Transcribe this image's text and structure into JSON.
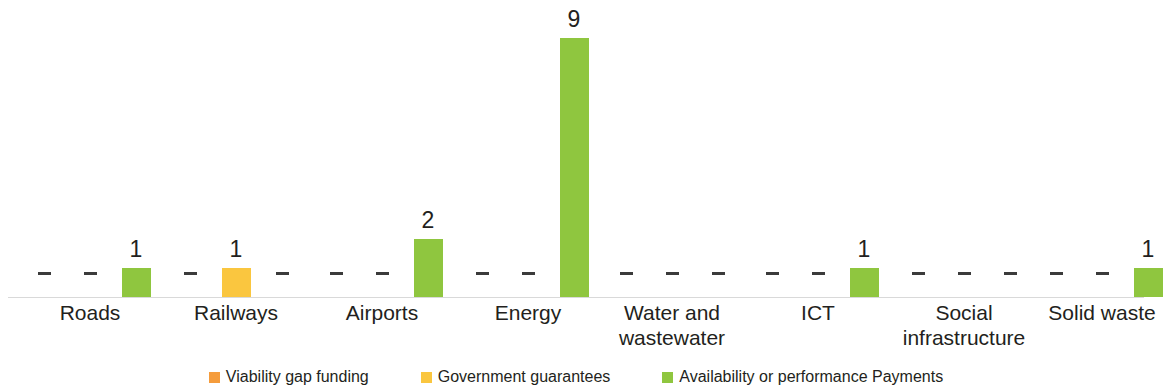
{
  "chart_data": {
    "type": "bar",
    "title": "",
    "subtitle": "",
    "xlabel": "",
    "ylabel": "",
    "grid": false,
    "legend_position": "bottom",
    "ylim": [
      0,
      9
    ],
    "zero_marker": "–",
    "categories": [
      "Roads",
      "Railways",
      "Airports",
      "Energy",
      "Water and wastewater",
      "ICT",
      "Social infrastructure",
      "Solid waste"
    ],
    "category_lines": [
      [
        "Roads"
      ],
      [
        "Railways"
      ],
      [
        "Airports"
      ],
      [
        "Energy"
      ],
      [
        "Water and",
        "wastewater"
      ],
      [
        "ICT"
      ],
      [
        "Social",
        "infrastructure"
      ],
      [
        "Solid waste"
      ]
    ],
    "series": [
      {
        "name": "Viability gap funding",
        "color": "#f59c3c",
        "key": "vgf",
        "values": [
          null,
          null,
          null,
          null,
          null,
          null,
          null,
          null
        ],
        "labels": [
          "–",
          "–",
          "–",
          "–",
          "–",
          "–",
          "–",
          "–"
        ]
      },
      {
        "name": "Government guarantees",
        "color": "#fac63f",
        "key": "gg",
        "values": [
          null,
          1,
          null,
          null,
          null,
          null,
          null,
          null
        ],
        "labels": [
          "–",
          "1",
          "–",
          "–",
          "–",
          "–",
          "–",
          "–"
        ]
      },
      {
        "name": "Availability or performance Payments",
        "color": "#8fc63f",
        "key": "apay",
        "values": [
          1,
          null,
          2,
          9,
          null,
          1,
          null,
          1
        ],
        "labels": [
          "1",
          "–",
          "2",
          "9",
          "–",
          "1",
          "–",
          "1"
        ]
      }
    ]
  },
  "legend": {
    "items": [
      {
        "label": "Viability gap funding",
        "color": "#f59c3c"
      },
      {
        "label": "Government guarantees",
        "color": "#fac63f"
      },
      {
        "label": "Availability or performance Payments",
        "color": "#8fc63f"
      }
    ]
  },
  "axis": {
    "baseline_color": "#d9d9d9"
  }
}
